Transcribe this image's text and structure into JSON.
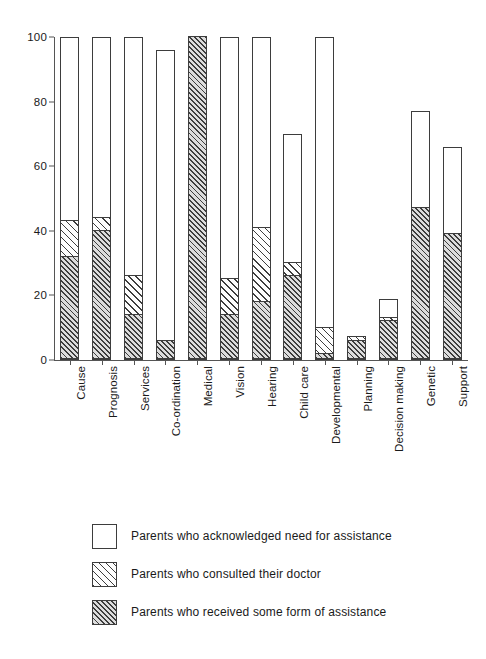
{
  "chart_data": {
    "type": "bar",
    "subtype": "stacked-overlay-bar",
    "title": "",
    "xlabel": "",
    "ylabel": "",
    "ylim": [
      0,
      100
    ],
    "yticks": [
      0,
      20,
      40,
      60,
      80,
      100
    ],
    "ytick_labels": [
      "0",
      "20",
      "40",
      "60",
      "80",
      "100"
    ],
    "grid": false,
    "legend_position": "below-plot",
    "categories": [
      "Cause",
      "Prognosis",
      "Services",
      "Co-ordination",
      "Medical",
      "Vision",
      "Hearing",
      "Child care",
      "Developmental",
      "Planning",
      "Decision making",
      "Genetic",
      "Support"
    ],
    "series": [
      {
        "name": "Parents who acknowledged need for assistance",
        "fill": "open",
        "values": [
          100,
          100,
          100,
          96,
          100,
          100,
          100,
          70,
          100,
          7,
          19,
          77,
          66
        ]
      },
      {
        "name": "Parents who consulted their doctor",
        "fill": "light-hatch",
        "values": [
          43,
          44,
          26,
          6,
          100,
          25,
          41,
          30,
          10,
          7,
          13,
          47,
          39
        ]
      },
      {
        "name": "Parents who received some form of assistance",
        "fill": "dense-hatch",
        "values": [
          32,
          40,
          14,
          6,
          100,
          14,
          18,
          26,
          2,
          6,
          12,
          47,
          39
        ]
      }
    ]
  },
  "legend": {
    "items": [
      {
        "label": "Parents who acknowledged need for assistance",
        "swatch": "open-square-swatch"
      },
      {
        "label": "Parents who consulted their doctor",
        "swatch": "light-hatch-square-swatch"
      },
      {
        "label": "Parents who received some form of assistance",
        "swatch": "dense-hatch-square-swatch"
      }
    ]
  },
  "colors": {
    "stroke": "#3d3d3d",
    "axis": "#555555",
    "open_fill": "#ffffff",
    "hatch_light_bg": "#fdfdfd",
    "hatch_dense_bg": "#dcdcdc",
    "text": "#1a1a1a"
  }
}
